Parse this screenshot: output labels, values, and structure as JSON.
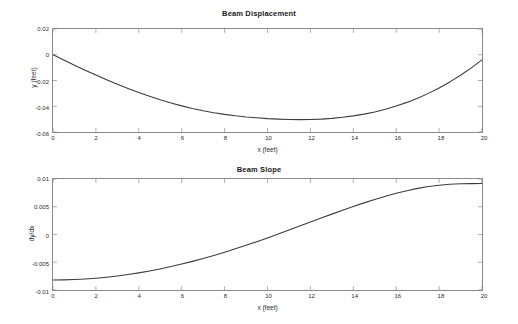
{
  "figure": {
    "background_color": "#ffffff",
    "axis_color": "#8a8a8a",
    "line_color": "#3c3c3c"
  },
  "chart_data": [
    {
      "type": "line",
      "title": "Beam Displacement",
      "xlabel": "x (feet)",
      "ylabel": "y (feet)",
      "xlim": [
        0,
        20
      ],
      "ylim": [
        -0.06,
        0.02
      ],
      "grid": false,
      "legend": null,
      "xticks": [
        0,
        2,
        4,
        6,
        8,
        10,
        12,
        14,
        16,
        18,
        20
      ],
      "xticklabels": [
        "0",
        "2",
        "4",
        "6",
        "8",
        "10",
        "12",
        "14",
        "16",
        "18",
        "20"
      ],
      "yticks": [
        0.02,
        0,
        -0.02,
        -0.04,
        -0.06
      ],
      "yticklabels": [
        "0.02",
        "0",
        "-0.02",
        "-0.04",
        "-0.06"
      ],
      "series": [
        {
          "name": "y",
          "x": [
            0,
            0.5,
            1,
            1.5,
            2,
            2.5,
            3,
            3.5,
            4,
            4.5,
            5,
            5.5,
            6,
            6.5,
            7,
            7.5,
            8,
            8.5,
            9,
            9.5,
            10,
            10.5,
            11,
            11.5,
            12,
            12.5,
            13,
            13.5,
            14,
            14.5,
            15,
            15.5,
            16,
            16.5,
            17,
            17.5,
            18,
            18.5,
            19,
            19.5,
            20
          ],
          "values": [
            0.0,
            -0.0041,
            -0.0081,
            -0.012,
            -0.0158,
            -0.0195,
            -0.023,
            -0.0263,
            -0.0294,
            -0.0323,
            -0.035,
            -0.0375,
            -0.0397,
            -0.0417,
            -0.0435,
            -0.045,
            -0.0463,
            -0.0474,
            -0.0483,
            -0.049,
            -0.0496,
            -0.05,
            -0.0503,
            -0.0504,
            -0.0503,
            -0.05,
            -0.0494,
            -0.0486,
            -0.0475,
            -0.0461,
            -0.0444,
            -0.0423,
            -0.0398,
            -0.037,
            -0.0337,
            -0.03,
            -0.0258,
            -0.0211,
            -0.0159,
            -0.0102,
            -0.004
          ]
        }
      ]
    },
    {
      "type": "line",
      "title": "Beam Slope",
      "xlabel": "x (feet)",
      "ylabel": "dy/dx",
      "xlim": [
        0,
        20
      ],
      "ylim": [
        -0.01,
        0.01
      ],
      "grid": false,
      "legend": null,
      "xticks": [
        0,
        2,
        4,
        6,
        8,
        10,
        12,
        14,
        16,
        18,
        20
      ],
      "xticklabels": [
        "0",
        "2",
        "4",
        "6",
        "8",
        "10",
        "12",
        "14",
        "16",
        "18",
        "20"
      ],
      "yticks": [
        0.01,
        0.005,
        0,
        -0.005,
        -0.01
      ],
      "yticklabels": [
        "0.01",
        "0.005",
        "0",
        "-0.005",
        "-0.01"
      ],
      "series": [
        {
          "name": "dy/dx",
          "x": [
            0,
            0.5,
            1,
            1.5,
            2,
            2.5,
            3,
            3.5,
            4,
            4.5,
            5,
            5.5,
            6,
            6.5,
            7,
            7.5,
            8,
            8.5,
            9,
            9.5,
            10,
            10.5,
            11,
            11.5,
            12,
            12.5,
            13,
            13.5,
            14,
            14.5,
            15,
            15.5,
            16,
            16.5,
            17,
            17.5,
            18,
            18.5,
            19,
            19.5,
            20
          ],
          "values": [
            -0.0082,
            -0.00818,
            -0.00812,
            -0.00802,
            -0.00788,
            -0.0077,
            -0.00748,
            -0.00722,
            -0.00692,
            -0.00658,
            -0.0062,
            -0.00578,
            -0.00533,
            -0.00484,
            -0.00432,
            -0.00377,
            -0.00319,
            -0.00258,
            -0.00195,
            -0.00129,
            -0.00061,
            9e-05,
            0.0008,
            0.00152,
            0.00224,
            0.00296,
            0.00367,
            0.00437,
            0.00505,
            0.0057,
            0.00632,
            0.0069,
            0.00743,
            0.0079,
            0.00831,
            0.00864,
            0.00888,
            0.00904,
            0.00913,
            0.00917,
            0.00918
          ]
        }
      ]
    }
  ]
}
